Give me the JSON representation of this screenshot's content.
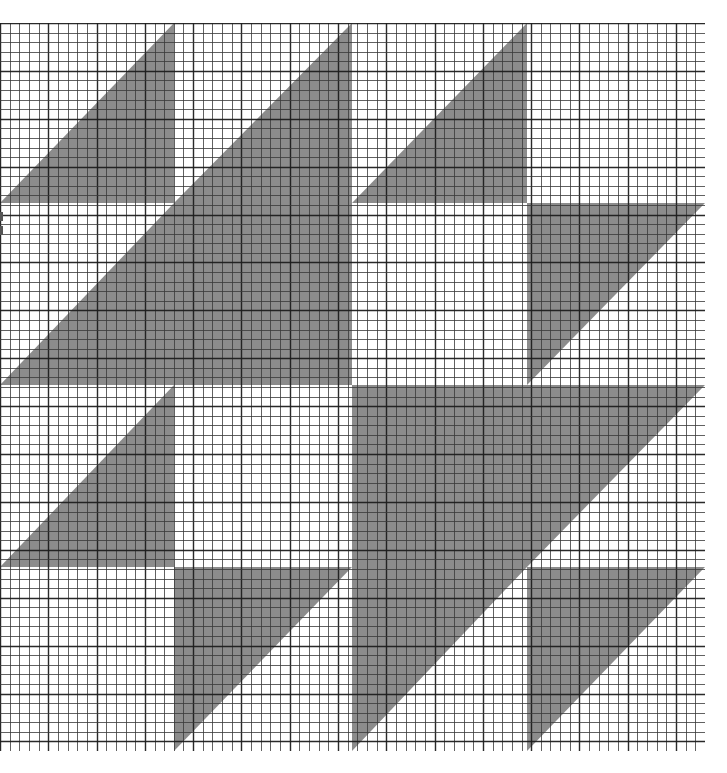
{
  "diagram": {
    "type": "quilt-chart-on-graph-paper",
    "grid": {
      "columns": 73,
      "rows": 76
    },
    "blocks": {
      "columns": 4,
      "rows": 4
    },
    "colors": {
      "paper": "#ffffff",
      "fill": "#8c8c8c",
      "grid_line": "#3a3a3a",
      "grid_line_heavy": "#1e1e1e"
    },
    "block_legend": {
      "LR": "lower-right triangle filled (diagonal bottom-left to top-right)",
      "UL": "upper-left triangle filled (diagonal bottom-left to top-right)",
      "F": "fully filled square",
      "W": "white / empty square"
    },
    "layout": [
      [
        "LR",
        "LR",
        "LR",
        "W"
      ],
      [
        "LR",
        "F",
        "W",
        "UL"
      ],
      [
        "LR",
        "W",
        "F",
        "UL"
      ],
      [
        "W",
        "UL",
        "UL",
        "UL"
      ]
    ]
  }
}
